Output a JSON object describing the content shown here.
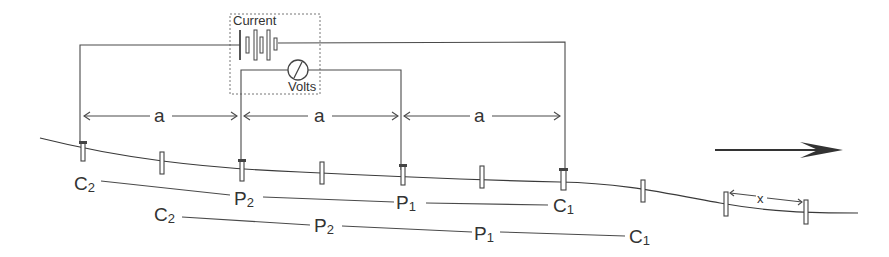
{
  "diagram": {
    "instrument": {
      "current_label": "Current",
      "volts_label": "Volts"
    },
    "spacing_label": "a",
    "stake_spacing_label": "x",
    "direction": "right",
    "electrodes_row1": [
      {
        "letter": "C",
        "sub": "2"
      },
      {
        "letter": "P",
        "sub": "2"
      },
      {
        "letter": "P",
        "sub": "1"
      },
      {
        "letter": "C",
        "sub": "1"
      }
    ],
    "electrodes_row2": [
      {
        "letter": "C",
        "sub": "2"
      },
      {
        "letter": "P",
        "sub": "2"
      },
      {
        "letter": "P",
        "sub": "1"
      },
      {
        "letter": "C",
        "sub": "1"
      }
    ],
    "colors": {
      "line": "#4a4a4a",
      "text": "#333333",
      "background": "#ffffff"
    }
  }
}
